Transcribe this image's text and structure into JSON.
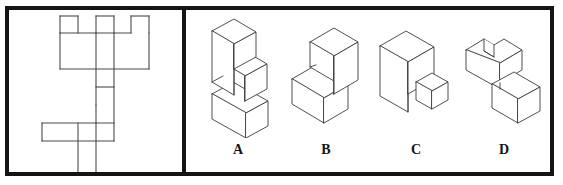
{
  "item": {
    "type": "spatial-reasoning-mental-rotation",
    "stimulus_panel_label": "",
    "options_panel_label": ""
  },
  "colors": {
    "frame": "#141414",
    "divider": "#141414",
    "net_stroke": "#4a4a4a",
    "figure_stroke": "#3c3c3c",
    "background": "#ffffff",
    "label_text": "#141414"
  },
  "net": {
    "name": "unfolded-net-pattern",
    "description": "Two-dimensional net of connected squares forming a crenellated top block, a vertical column, and a lower T-shaped arm",
    "grid_unit_px": 18,
    "segments": [
      "M 60,16 L 60,33",
      "M 60,16 L 78,16",
      "M 78,16 L 78,33",
      "M 96,16 L 96,33",
      "M 96,16 L 114,16",
      "M 114,16 L 114,33",
      "M 131,16 L 131,33",
      "M 131,16 L 149,16",
      "M 149,16 L 149,33",
      "M 60,33 L 131,33",
      "M 60,33 L 60,69",
      "M 60,69 L 149,69",
      "M 149,33 L 149,69",
      "M 96,33 L 96,105",
      "M 114,33 L 114,141",
      "M 96,87 L 114,87",
      "M 96,105 L 96,123",
      "M 42,123 L 114,123",
      "M 42,123 L 42,141",
      "M 42,141 L 114,141",
      "M 78,123 L 78,176",
      "M 96,123 L 96,176",
      "M 78,176 L 96,176"
    ]
  },
  "options": [
    {
      "label": "A",
      "name": "option-a",
      "figure_name": "isometric-staircase-three-step",
      "description": "Three stacked blocks forming a descending staircase: tall upright block at top-left, single cube step in the middle, horizontal block at bottom-right"
    },
    {
      "label": "B",
      "name": "option-b",
      "figure_name": "isometric-two-block-step",
      "description": "Two rectangular blocks forming a single step: upper-right block sitting on top of a lower-left horizontal block"
    },
    {
      "label": "C",
      "name": "option-c",
      "figure_name": "isometric-slab-and-detached-cube",
      "description": "Tall upright slab on the left with a separate small cube to its lower right"
    },
    {
      "label": "D",
      "name": "option-d",
      "figure_name": "isometric-notched-block-with-step",
      "description": "Upper horizontal block with a notch cut into its top-left corner, plus a lower-right block forming a step"
    }
  ]
}
